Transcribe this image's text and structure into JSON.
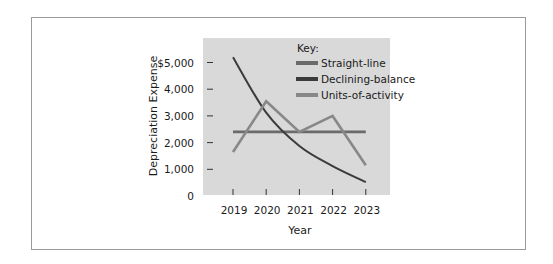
{
  "chart_data": {
    "type": "line",
    "title": "",
    "xlabel": "Year",
    "ylabel": "Depreciation Expense",
    "x": [
      "2019",
      "2020",
      "2021",
      "2022",
      "2023"
    ],
    "y_ticks": [
      0,
      1000,
      2000,
      3000,
      4000,
      5000
    ],
    "y_tick_labels": [
      "0",
      "1,000",
      "2,000",
      "3,000",
      "4,000",
      "$5,000"
    ],
    "ylim": [
      0,
      5000
    ],
    "grid": false,
    "legend": {
      "title": "Key:",
      "placement": "top-right",
      "entries": [
        "Straight-line",
        "Declining-balance",
        "Units-of-activity"
      ]
    },
    "series": [
      {
        "name": "Straight-line",
        "color": "#6b6b6b",
        "smooth": false,
        "values": [
          2400,
          2400,
          2400,
          2400,
          2400
        ]
      },
      {
        "name": "Declining-balance",
        "color": "#3b3b3b",
        "smooth": true,
        "values": [
          5200,
          3120,
          1870,
          1120,
          520
        ]
      },
      {
        "name": "Units-of-activity",
        "color": "#888888",
        "smooth": false,
        "values": [
          1650,
          3550,
          2400,
          3000,
          1150
        ]
      }
    ],
    "plot_background": "#d9d9d9"
  }
}
